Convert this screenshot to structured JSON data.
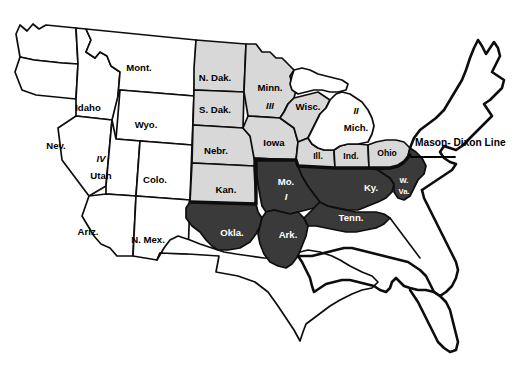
{
  "map": {
    "title": "United States regional map with Mason-Dixon Line",
    "background_color": "#ffffff",
    "border_color": "#0d0d0d",
    "shading": {
      "unshaded_color": "#ffffff",
      "light_color": "#d8d8d8",
      "dark_color": "#3a3a3a"
    },
    "annotations": [
      {
        "id": "mason-dixon",
        "label": "Mason- Dixon Line"
      }
    ],
    "region_numerals": [
      {
        "numeral": "I",
        "anchor_state": "Mo."
      },
      {
        "numeral": "II",
        "anchor_state": "Mich."
      },
      {
        "numeral": "III",
        "anchor_state": "Minn."
      },
      {
        "numeral": "IV",
        "anchor_state": "Utah"
      }
    ],
    "states": [
      {
        "abbr": "Mont.",
        "shade": "none",
        "x": 139,
        "y": 68
      },
      {
        "abbr": "Idaho",
        "shade": "none",
        "x": 88,
        "y": 108
      },
      {
        "abbr": "Wyo.",
        "shade": "none",
        "x": 146,
        "y": 125
      },
      {
        "abbr": "Nev.",
        "shade": "none",
        "x": 56,
        "y": 146
      },
      {
        "abbr": "Utah",
        "shade": "none",
        "x": 101,
        "y": 172
      },
      {
        "abbr": "Colo.",
        "shade": "none",
        "x": 155,
        "y": 180
      },
      {
        "abbr": "Ariz.",
        "shade": "none",
        "x": 88,
        "y": 232
      },
      {
        "abbr": "N. Mex.",
        "shade": "none",
        "x": 148,
        "y": 240
      },
      {
        "abbr": "N. Dak.",
        "shade": "light",
        "x": 215,
        "y": 78
      },
      {
        "abbr": "S. Dak.",
        "shade": "light",
        "x": 215,
        "y": 110
      },
      {
        "abbr": "Nebr.",
        "shade": "light",
        "x": 216,
        "y": 151
      },
      {
        "abbr": "Kan.",
        "shade": "light",
        "x": 226,
        "y": 190
      },
      {
        "abbr": "Minn.",
        "shade": "light",
        "x": 270,
        "y": 88
      },
      {
        "abbr": "Iowa",
        "shade": "light",
        "x": 274,
        "y": 143
      },
      {
        "abbr": "Wisc.",
        "shade": "light",
        "x": 308,
        "y": 107
      },
      {
        "abbr": "Mich.",
        "shade": "none",
        "x": 356,
        "y": 124
      },
      {
        "abbr": "Ill.",
        "shade": "light",
        "x": 318,
        "y": 156
      },
      {
        "abbr": "Ind.",
        "shade": "light",
        "x": 351,
        "y": 156
      },
      {
        "abbr": "Ohio",
        "shade": "light",
        "x": 386,
        "y": 154
      },
      {
        "abbr": "Mo.",
        "shade": "dark",
        "x": 286,
        "y": 184
      },
      {
        "abbr": "Okla.",
        "shade": "dark",
        "x": 232,
        "y": 233
      },
      {
        "abbr": "Ark.",
        "shade": "dark",
        "x": 288,
        "y": 235
      },
      {
        "abbr": "Tenn.",
        "shade": "dark",
        "x": 351,
        "y": 218
      },
      {
        "abbr": "Ky.",
        "shade": "dark",
        "x": 371,
        "y": 188
      },
      {
        "abbr": "W. Va.",
        "shade": "dark",
        "x": 404,
        "y": 186
      }
    ]
  }
}
